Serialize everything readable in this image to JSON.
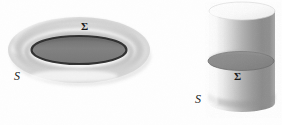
{
  "figure": {
    "background_color": "#fefefe",
    "ink_color": "#1a1a1a",
    "shapes": [
      {
        "id": "torus",
        "name": "torus",
        "surface_label": "S",
        "section_label": "Σ",
        "body_color": "#f2f2f2",
        "shadow_color": "#b9b9b9",
        "disk_color": "#7f7f7f",
        "disk_outline_color": "#2b2b2b",
        "center_x": 79,
        "center_y": 50,
        "outer_rx": 71,
        "outer_ry": 33,
        "inner_rx": 47,
        "inner_ry": 14
      },
      {
        "id": "cylinder",
        "name": "cylinder",
        "surface_label": "S",
        "section_label": "Σ",
        "body_light_color": "#f0f0f0",
        "body_mid_color": "#c8c8c8",
        "body_dark_color": "#8d8d8d",
        "disk_color": "#8a8a8a",
        "disk_outline_color": "#4a4a4a",
        "left_x": 209,
        "right_x": 275,
        "top_y": 11,
        "bottom_y": 112,
        "cap_ry": 9,
        "section_center_y": 61,
        "section_ry": 9
      }
    ],
    "labels": [
      {
        "id": "torus-sigma",
        "text": "Σ",
        "x": 81,
        "y": 20,
        "style": "sigma"
      },
      {
        "id": "torus-s",
        "text": "S",
        "x": 14,
        "y": 69,
        "style": "s"
      },
      {
        "id": "cyl-sigma",
        "text": "Σ",
        "x": 234,
        "y": 70,
        "style": "sigma"
      },
      {
        "id": "cyl-s",
        "text": "S",
        "x": 195,
        "y": 92,
        "style": "s"
      }
    ]
  }
}
